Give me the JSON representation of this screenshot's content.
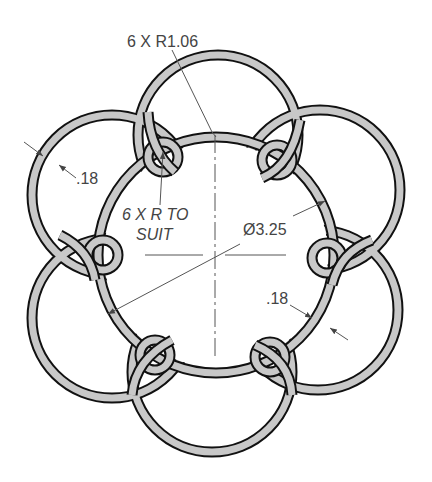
{
  "drawing": {
    "type": "technical drawing",
    "subject": "interlaced ring ornament",
    "colors": {
      "band_fill": "#c8c8c8",
      "band_outline": "#111111",
      "dimension_line": "#555555",
      "text": "#444444"
    }
  },
  "annotations": {
    "outer_radius": "6 X R1.06",
    "loop_radius_line1": "6 X R TO",
    "loop_radius_line2": "SUIT",
    "diameter": "Ø3.25",
    "thickness_left": ".18",
    "thickness_right": ".18"
  }
}
